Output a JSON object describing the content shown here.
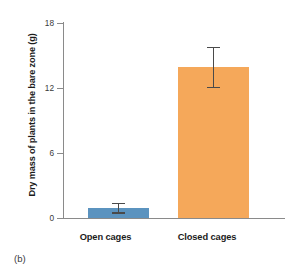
{
  "panel": {
    "tag": "(b)"
  },
  "chart_data": {
    "type": "bar",
    "title": "",
    "subtitle": "",
    "xlabel": "",
    "ylabel": "Dry mass of plants in the bare zone (g)",
    "categories": [
      "Open cages",
      "Closed cages"
    ],
    "values": [
      0.9,
      13.9
    ],
    "errors_low": [
      0.4,
      12.0
    ],
    "errors_high": [
      1.4,
      15.8
    ],
    "ylim": [
      0,
      18
    ],
    "yticks": [
      0,
      6,
      12,
      18
    ],
    "ytick_labels": [
      "0",
      "6",
      "12",
      "18"
    ],
    "grid": false,
    "legend": "none",
    "bar_colors": [
      "#5b93bf",
      "#f5a85a"
    ],
    "error_bar_color": "#4a4a4a",
    "axis_color": "#8a8a8a",
    "background": "#ffffff"
  }
}
